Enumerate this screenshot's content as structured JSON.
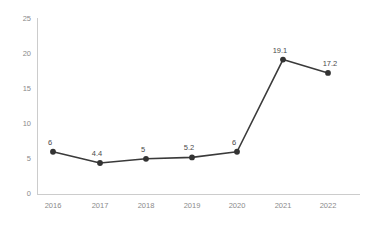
{
  "chart_data": {
    "type": "line",
    "title": "",
    "subtitle": "",
    "xlabel": "",
    "ylabel": "",
    "categories": [
      "2016",
      "2017",
      "2018",
      "2019",
      "2020",
      "2021",
      "2022"
    ],
    "values": [
      6,
      4.4,
      5,
      5.2,
      6,
      19.1,
      17.2
    ],
    "point_labels": [
      "6",
      "4.4",
      "5",
      "5.2",
      "6",
      "19.1",
      "17.2"
    ],
    "ylim": [
      0,
      25
    ],
    "y_ticks": [
      0,
      5,
      10,
      15,
      20,
      25
    ],
    "y_tick_labels": [
      "0",
      "5",
      "10",
      "15",
      "20",
      "25"
    ],
    "grid": false,
    "legend": null,
    "series": [
      {
        "name": "",
        "values": [
          6,
          4.4,
          5,
          5.2,
          6,
          19.1,
          17.2
        ]
      }
    ],
    "colors": {
      "line": "#3a3a3a",
      "marker": "#333333",
      "axis": "#cccccc",
      "tick_text": "#8a8a8a",
      "label_text": "#4a4a4a",
      "background": "#ffffff"
    }
  }
}
